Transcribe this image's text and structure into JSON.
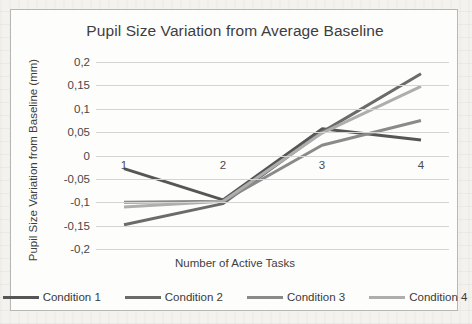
{
  "chart_data": {
    "type": "line",
    "title": "Pupil Size Variation from Average Baseline",
    "xlabel": "Number of Active Tasks",
    "ylabel": "Pupil Size Variation from Baseline (mm)",
    "categories": [
      "1",
      "2",
      "3",
      "4"
    ],
    "ytick_labels": [
      "0,2",
      "0,15",
      "0,1",
      "0,05",
      "0",
      "-0,05",
      "-0,1",
      "-0,15",
      "-0,2"
    ],
    "ytick_values": [
      0.2,
      0.15,
      0.1,
      0.05,
      0,
      -0.05,
      -0.1,
      -0.15,
      -0.2
    ],
    "ylim": [
      -0.2,
      0.2
    ],
    "grid": "horizontal",
    "legend_position": "bottom",
    "decimal_separator": ",",
    "series": [
      {
        "name": "Condition 1",
        "values": [
          -0.028,
          -0.095,
          0.057,
          0.033
        ],
        "color": "#565656"
      },
      {
        "name": "Condition 2",
        "values": [
          -0.148,
          -0.103,
          0.05,
          0.175
        ],
        "color": "#6b6b6b"
      },
      {
        "name": "Condition 3",
        "values": [
          -0.1,
          -0.098,
          0.022,
          0.075
        ],
        "color": "#8a8a8a"
      },
      {
        "name": "Condition 4",
        "values": [
          -0.11,
          -0.098,
          0.048,
          0.148
        ],
        "color": "#aeaeae"
      }
    ]
  },
  "legend": {
    "items": [
      {
        "label": "Condition 1"
      },
      {
        "label": "Condition 2"
      },
      {
        "label": "Condition 3"
      },
      {
        "label": "Condition 4"
      }
    ]
  }
}
